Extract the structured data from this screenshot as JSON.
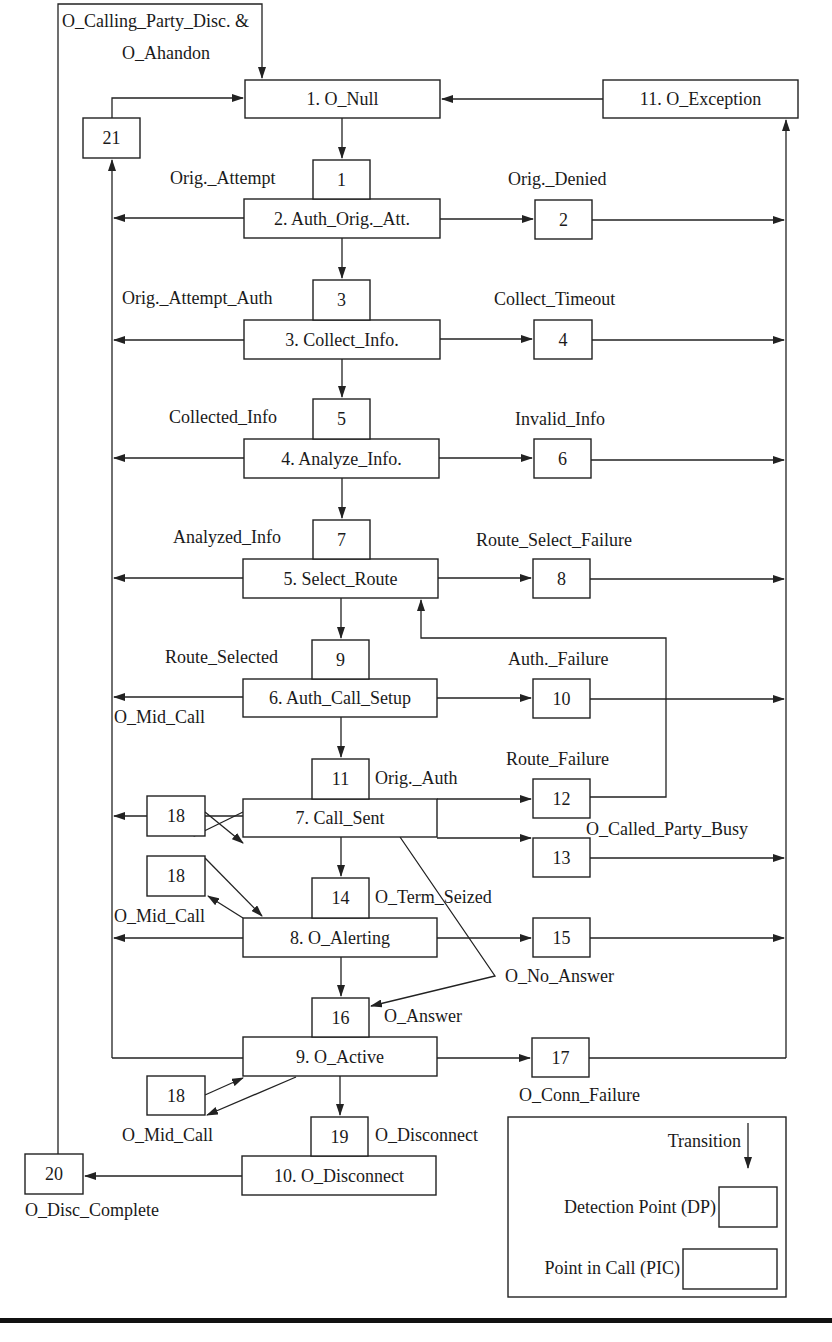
{
  "pics": [
    {
      "id": "pic1",
      "label": "1. O_Null",
      "x": 245,
      "y": 80,
      "w": 195,
      "h": 38
    },
    {
      "id": "pic11",
      "label": "11. O_Exception",
      "x": 603,
      "y": 80,
      "w": 195,
      "h": 38
    },
    {
      "id": "pic2",
      "label": "2. Auth_Orig._Att.",
      "x": 244,
      "y": 199,
      "w": 196,
      "h": 39
    },
    {
      "id": "pic3",
      "label": "3. Collect_Info.",
      "x": 244,
      "y": 320,
      "w": 196,
      "h": 39
    },
    {
      "id": "pic4",
      "label": "4. Analyze_Info.",
      "x": 244,
      "y": 439,
      "w": 195,
      "h": 39
    },
    {
      "id": "pic5",
      "label": "5. Select_Route",
      "x": 243,
      "y": 559,
      "w": 195,
      "h": 39
    },
    {
      "id": "pic6",
      "label": "6. Auth_Call_Setup",
      "x": 243,
      "y": 679,
      "w": 194,
      "h": 38
    },
    {
      "id": "pic7",
      "label": "7. Call_Sent",
      "x": 243,
      "y": 799,
      "w": 194,
      "h": 38
    },
    {
      "id": "pic8",
      "label": "8. O_Alerting",
      "x": 243,
      "y": 918,
      "w": 194,
      "h": 39
    },
    {
      "id": "pic9",
      "label": "9. O_Active",
      "x": 243,
      "y": 1037,
      "w": 194,
      "h": 39
    },
    {
      "id": "pic10",
      "label": "10. O_Disconnect",
      "x": 242,
      "y": 1156,
      "w": 194,
      "h": 39
    }
  ],
  "dps": [
    {
      "id": "dp1",
      "num": "1",
      "x": 313,
      "y": 160,
      "w": 57,
      "h": 39
    },
    {
      "id": "dp2",
      "num": "2",
      "x": 535,
      "y": 200,
      "w": 57,
      "h": 39
    },
    {
      "id": "dp3",
      "num": "3",
      "x": 313,
      "y": 280,
      "w": 57,
      "h": 40
    },
    {
      "id": "dp4",
      "num": "4",
      "x": 534,
      "y": 320,
      "w": 58,
      "h": 39
    },
    {
      "id": "dp5",
      "num": "5",
      "x": 313,
      "y": 399,
      "w": 57,
      "h": 40
    },
    {
      "id": "dp6",
      "num": "6",
      "x": 534,
      "y": 439,
      "w": 57,
      "h": 39
    },
    {
      "id": "dp7",
      "num": "7",
      "x": 313,
      "y": 520,
      "w": 57,
      "h": 39
    },
    {
      "id": "dp8",
      "num": "8",
      "x": 533,
      "y": 559,
      "w": 57,
      "h": 39
    },
    {
      "id": "dp9",
      "num": "9",
      "x": 312,
      "y": 640,
      "w": 57,
      "h": 39
    },
    {
      "id": "dp10",
      "num": "10",
      "x": 533,
      "y": 679,
      "w": 57,
      "h": 39
    },
    {
      "id": "dp11",
      "num": "11",
      "x": 312,
      "y": 759,
      "w": 57,
      "h": 40
    },
    {
      "id": "dp12",
      "num": "12",
      "x": 533,
      "y": 779,
      "w": 57,
      "h": 39
    },
    {
      "id": "dp13",
      "num": "13",
      "x": 533,
      "y": 838,
      "w": 57,
      "h": 39
    },
    {
      "id": "dp14",
      "num": "14",
      "x": 312,
      "y": 878,
      "w": 57,
      "h": 40
    },
    {
      "id": "dp15",
      "num": "15",
      "x": 533,
      "y": 918,
      "w": 57,
      "h": 39
    },
    {
      "id": "dp16",
      "num": "16",
      "x": 312,
      "y": 998,
      "w": 57,
      "h": 39
    },
    {
      "id": "dp17",
      "num": "17",
      "x": 532,
      "y": 1038,
      "w": 57,
      "h": 39
    },
    {
      "id": "dp18a",
      "num": "18",
      "x": 147,
      "y": 796,
      "w": 58,
      "h": 40
    },
    {
      "id": "dp18b",
      "num": "18",
      "x": 147,
      "y": 856,
      "w": 58,
      "h": 40
    },
    {
      "id": "dp18c",
      "num": "18",
      "x": 147,
      "y": 1076,
      "w": 58,
      "h": 39
    },
    {
      "id": "dp19",
      "num": "19",
      "x": 311,
      "y": 1117,
      "w": 57,
      "h": 39
    },
    {
      "id": "dp20",
      "num": "20",
      "x": 25,
      "y": 1154,
      "w": 58,
      "h": 40
    },
    {
      "id": "dp21",
      "num": "21",
      "x": 83,
      "y": 118,
      "w": 57,
      "h": 40
    }
  ],
  "labels": [
    {
      "id": "lbl-calling-party-disc",
      "text": "O_Calling_Party_Disc. &",
      "x": 62,
      "y": 27,
      "anchor": "start"
    },
    {
      "id": "lbl-abandon",
      "text": "O_Ahandon",
      "x": 122,
      "y": 59,
      "anchor": "start"
    },
    {
      "id": "lbl-orig-attempt",
      "text": "Orig._Attempt",
      "x": 170,
      "y": 184,
      "anchor": "start"
    },
    {
      "id": "lbl-orig-denied",
      "text": "Orig._Denied",
      "x": 508,
      "y": 185,
      "anchor": "start"
    },
    {
      "id": "lbl-orig-attempt-auth",
      "text": "Orig._Attempt_Auth",
      "x": 122,
      "y": 304,
      "anchor": "start"
    },
    {
      "id": "lbl-collect-timeout",
      "text": "Collect_Timeout",
      "x": 494,
      "y": 305,
      "anchor": "start"
    },
    {
      "id": "lbl-collected-info",
      "text": "Collected_Info",
      "x": 169,
      "y": 423,
      "anchor": "start"
    },
    {
      "id": "lbl-invalid-info",
      "text": "Invalid_Info",
      "x": 515,
      "y": 425,
      "anchor": "start"
    },
    {
      "id": "lbl-analyzed-info",
      "text": "Analyzed_Info",
      "x": 173,
      "y": 543,
      "anchor": "start"
    },
    {
      "id": "lbl-route-select-failure",
      "text": "Route_Select_Failure",
      "x": 476,
      "y": 546,
      "anchor": "start"
    },
    {
      "id": "lbl-route-selected",
      "text": "Route_Selected",
      "x": 165,
      "y": 663,
      "anchor": "start"
    },
    {
      "id": "lbl-auth-failure",
      "text": "Auth._Failure",
      "x": 508,
      "y": 665,
      "anchor": "start"
    },
    {
      "id": "lbl-o-mid-call-1",
      "text": "O_Mid_Call",
      "x": 114,
      "y": 723,
      "anchor": "start"
    },
    {
      "id": "lbl-orig-auth",
      "text": "Orig._Auth",
      "x": 375,
      "y": 784,
      "anchor": "start"
    },
    {
      "id": "lbl-route-failure",
      "text": "Route_Failure",
      "x": 506,
      "y": 765,
      "anchor": "start"
    },
    {
      "id": "lbl-called-party-busy",
      "text": "O_Called_Party_Busy",
      "x": 586,
      "y": 835,
      "anchor": "start"
    },
    {
      "id": "lbl-term-seized",
      "text": "O_Term_Seized",
      "x": 375,
      "y": 903,
      "anchor": "start"
    },
    {
      "id": "lbl-o-mid-call-2",
      "text": "O_Mid_Call",
      "x": 114,
      "y": 922,
      "anchor": "start"
    },
    {
      "id": "lbl-no-answer",
      "text": "O_No_Answer",
      "x": 505,
      "y": 982,
      "anchor": "start"
    },
    {
      "id": "lbl-o-answer",
      "text": "O_Answer",
      "x": 384,
      "y": 1022,
      "anchor": "start"
    },
    {
      "id": "lbl-conn-failure",
      "text": "O_Conn_Failure",
      "x": 519,
      "y": 1101,
      "anchor": "start"
    },
    {
      "id": "lbl-o-mid-call-3",
      "text": "O_Mid_Call",
      "x": 122,
      "y": 1141,
      "anchor": "start"
    },
    {
      "id": "lbl-o-disconnect",
      "text": "O_Disconnect",
      "x": 375,
      "y": 1141,
      "anchor": "start"
    },
    {
      "id": "lbl-disc-complete",
      "text": "O_Disc_Complete",
      "x": 25,
      "y": 1216,
      "anchor": "start"
    }
  ],
  "legend": {
    "x": 508,
    "y": 1117,
    "w": 278,
    "h": 180,
    "transition_label": "Transition",
    "dp_label": "Detection Point (DP)",
    "pic_label": "Point in Call (PIC)"
  },
  "colors": {
    "line": "#222222",
    "background": "#ffffff",
    "rule": "#111111"
  }
}
